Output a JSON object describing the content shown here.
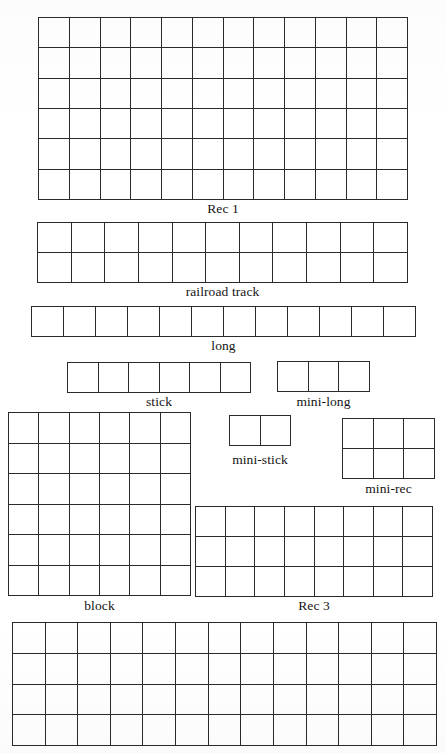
{
  "page": {
    "background_color": "#ffffff",
    "line_color": "#2a2a2a",
    "text_color": "#141414",
    "width": 446,
    "height": 753
  },
  "figures": [
    {
      "id": "rec-1",
      "label": "Rec 1",
      "columns": 12,
      "rows": 6,
      "cell_count": 72,
      "label_visible": true,
      "box": {
        "x": 38,
        "y": 17,
        "width": 370,
        "height": 183
      },
      "label_y": 201
    },
    {
      "id": "railroad-track",
      "label": "railroad track",
      "columns": 11,
      "rows": 2,
      "cell_count": 22,
      "label_visible": true,
      "box": {
        "x": 37,
        "y": 222,
        "width": 371,
        "height": 61
      },
      "label_y": 284
    },
    {
      "id": "long",
      "label": "long",
      "columns": 12,
      "rows": 1,
      "cell_count": 12,
      "label_visible": true,
      "box": {
        "x": 31,
        "y": 306,
        "width": 385,
        "height": 31
      },
      "label_y": 338
    },
    {
      "id": "stick",
      "label": "stick",
      "columns": 6,
      "rows": 1,
      "cell_count": 6,
      "label_visible": true,
      "box": {
        "x": 67,
        "y": 362,
        "width": 184,
        "height": 31
      },
      "label_y": 394
    },
    {
      "id": "mini-long",
      "label": "mini-long",
      "columns": 3,
      "rows": 1,
      "cell_count": 3,
      "label_visible": true,
      "box": {
        "x": 277,
        "y": 361,
        "width": 93,
        "height": 31
      },
      "label_y": 394
    },
    {
      "id": "block",
      "label": "block",
      "columns": 6,
      "rows": 6,
      "cell_count": 36,
      "label_visible": true,
      "box": {
        "x": 8,
        "y": 412,
        "width": 183,
        "height": 184
      },
      "label_y": 598
    },
    {
      "id": "mini-stick",
      "label": "mini-stick",
      "columns": 2,
      "rows": 1,
      "cell_count": 2,
      "label_visible": true,
      "box": {
        "x": 229,
        "y": 415,
        "width": 62,
        "height": 31
      },
      "label_y": 452
    },
    {
      "id": "mini-rec",
      "label": "mini-rec",
      "columns": 3,
      "rows": 2,
      "cell_count": 6,
      "label_visible": true,
      "box": {
        "x": 342,
        "y": 418,
        "width": 93,
        "height": 61
      },
      "label_y": 481
    },
    {
      "id": "rec-3",
      "label": "Rec 3",
      "columns": 8,
      "rows": 3,
      "cell_count": 24,
      "label_visible": true,
      "box": {
        "x": 195,
        "y": 506,
        "width": 238,
        "height": 91
      },
      "label_y": 598
    },
    {
      "id": "rec-2",
      "label": "",
      "columns": 13,
      "rows": 4,
      "cell_count": 52,
      "label_visible": false,
      "box": {
        "x": 12,
        "y": 622,
        "width": 425,
        "height": 124
      },
      "label_y": 747
    }
  ]
}
